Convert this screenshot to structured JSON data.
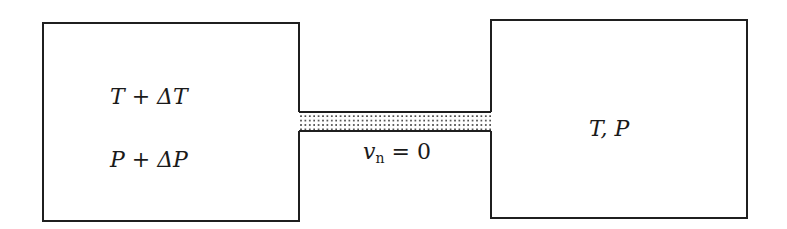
{
  "diagram": {
    "left_reservoir": {
      "line1": "T + ΔT",
      "line2": "P + ΔP"
    },
    "channel": {
      "label_var": "v",
      "label_sub": "n",
      "label_rest": " = 0"
    },
    "right_reservoir": {
      "label": "T, P"
    },
    "colors": {
      "stroke": "#1f1f1f",
      "dots": "#333333",
      "background": "#ffffff"
    }
  }
}
